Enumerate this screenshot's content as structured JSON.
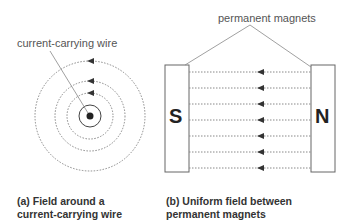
{
  "labels": {
    "wire": "current-carrying wire",
    "magnets": "permanent magnets"
  },
  "poles": {
    "south": "S",
    "north": "N"
  },
  "captions": {
    "a_line1": "(a) Field around a",
    "a_line2": "current-carrying wire",
    "b_line1": "(b) Uniform field between",
    "b_line2": "permanent magnets"
  },
  "diagram": {
    "a": {
      "center": [
        90,
        116
      ],
      "solid_ring_radius": 11,
      "dotted_radii": [
        23,
        35,
        55
      ],
      "arrow_direction": "counterclockwise"
    },
    "b": {
      "field_lines": 7,
      "arrow_direction": "N to S (right to left)"
    }
  }
}
